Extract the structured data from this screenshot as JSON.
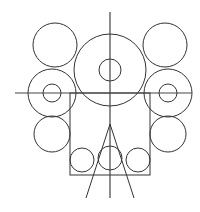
{
  "diagram": {
    "title": "",
    "stroke_color": "#333333",
    "background": "#ffffff",
    "axes": {
      "vertical": {
        "x": 110,
        "y1": 12,
        "y2": 198
      },
      "horizontal": {
        "y": 93,
        "x1": 15,
        "x2": 192
      }
    },
    "circles": [
      {
        "id": "central-large",
        "cx": 110,
        "cy": 70,
        "r": 36
      },
      {
        "id": "central-small",
        "cx": 110,
        "cy": 70,
        "r": 11
      },
      {
        "id": "top-left",
        "cx": 55,
        "cy": 45,
        "r": 22
      },
      {
        "id": "top-right",
        "cx": 165,
        "cy": 45,
        "r": 22
      },
      {
        "id": "mid-left-outer",
        "cx": 52,
        "cy": 93,
        "r": 24
      },
      {
        "id": "mid-left-inner",
        "cx": 52,
        "cy": 93,
        "r": 9
      },
      {
        "id": "mid-right-outer",
        "cx": 168,
        "cy": 93,
        "r": 24
      },
      {
        "id": "mid-right-inner",
        "cx": 168,
        "cy": 93,
        "r": 9
      },
      {
        "id": "lower-left",
        "cx": 52,
        "cy": 134,
        "r": 18
      },
      {
        "id": "lower-right",
        "cx": 168,
        "cy": 134,
        "r": 18
      },
      {
        "id": "bottom-left",
        "cx": 82,
        "cy": 160,
        "r": 12
      },
      {
        "id": "bottom-center",
        "cx": 110,
        "cy": 158,
        "r": 12
      },
      {
        "id": "bottom-right",
        "cx": 138,
        "cy": 160,
        "r": 12
      }
    ],
    "rectangle": {
      "x": 70,
      "y": 93,
      "width": 80,
      "height": 82
    },
    "triangle": {
      "apex": {
        "x": 110,
        "y": 124
      },
      "left_end": {
        "x": 86,
        "y": 198
      },
      "right_end": {
        "x": 134,
        "y": 198
      }
    }
  }
}
